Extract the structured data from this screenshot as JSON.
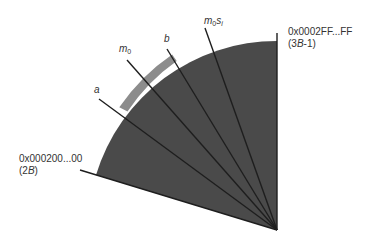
{
  "diagram": {
    "type": "sector-wheel",
    "colors": {
      "sector_fill": "#4a4a4a",
      "band_fill": "#8c8c8c",
      "line": "#1e1e1e",
      "text": "#333333",
      "background": "#ffffff"
    },
    "labels": {
      "a": "a",
      "m0_base": "m",
      "m0_sub": "0",
      "b": "b",
      "m0si_base": "m",
      "m0si_sub0": "0",
      "m0si_s": "s",
      "m0si_sub_i": "i",
      "end_address": "0x0002FF...FF",
      "end_value_prefix": "(3",
      "end_value_var": "B",
      "end_value_suffix": "-1)",
      "start_address": "0x000200...00",
      "start_value_prefix": "(2",
      "start_value_var": "B",
      "start_value_suffix": ")"
    }
  }
}
